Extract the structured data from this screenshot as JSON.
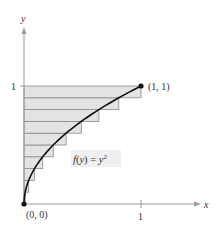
{
  "figure": {
    "axis_labels": {
      "x": "x",
      "y": "y"
    },
    "tick_labels": {
      "x_one": "1",
      "y_one": "1"
    },
    "points": [
      {
        "label": "(0, 0)",
        "x": 0,
        "y": 0
      },
      {
        "label": "(1, 1)",
        "x": 1,
        "y": 1
      }
    ],
    "function_label": {
      "prefix": "f(y) = y",
      "exponent": "2"
    },
    "colors": {
      "shade": "#e3e3e3",
      "curve": "#111111",
      "axis": "#9a9a9a",
      "rect_stroke": "#8a8a8a"
    }
  },
  "chart_data": {
    "type": "diagram",
    "title": "",
    "function": "f(y) = y^2",
    "interval": [
      0,
      1
    ],
    "n_rectangles": 10,
    "rectangles": [
      {
        "y_range": [
          0.0,
          0.1
        ],
        "width": 0.01
      },
      {
        "y_range": [
          0.1,
          0.2
        ],
        "width": 0.04
      },
      {
        "y_range": [
          0.2,
          0.3
        ],
        "width": 0.09
      },
      {
        "y_range": [
          0.3,
          0.4
        ],
        "width": 0.16
      },
      {
        "y_range": [
          0.4,
          0.5
        ],
        "width": 0.25
      },
      {
        "y_range": [
          0.5,
          0.6
        ],
        "width": 0.36
      },
      {
        "y_range": [
          0.6,
          0.7
        ],
        "width": 0.49
      },
      {
        "y_range": [
          0.7,
          0.8
        ],
        "width": 0.64
      },
      {
        "y_range": [
          0.8,
          0.9
        ],
        "width": 0.81
      },
      {
        "y_range": [
          0.9,
          1.0
        ],
        "width": 1.0
      }
    ],
    "xlabel": "x",
    "ylabel": "y",
    "xlim": [
      0,
      1.4
    ],
    "ylim": [
      0,
      1.5
    ],
    "annotations": [
      "(0, 0)",
      "(1, 1)",
      "f(y) = y^2"
    ]
  }
}
